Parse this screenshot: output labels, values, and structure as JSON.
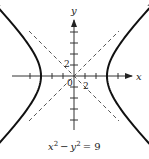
{
  "chart_data": {
    "type": "line",
    "title": "",
    "caption": "x² − y² = 9",
    "equation": {
      "lhs_x": "x",
      "lhs_x_exp": "2",
      "minus": "−",
      "lhs_y": "y",
      "lhs_y_exp": "2",
      "rhs": "= 9"
    },
    "xlabel": "x",
    "ylabel": "y",
    "origin_label": "0",
    "tick_labels": {
      "x": "2",
      "y": "2"
    },
    "xlim": [
      -5.5,
      5.5
    ],
    "ylim": [
      -5,
      5
    ],
    "grid": false,
    "legend": null,
    "series": [
      {
        "name": "hyperbola right branch",
        "style": "solid-thick",
        "vertex": [
          3,
          0
        ]
      },
      {
        "name": "hyperbola left branch",
        "style": "solid-thick",
        "vertex": [
          -3,
          0
        ]
      },
      {
        "name": "asymptote y = x",
        "style": "dashed"
      },
      {
        "name": "asymptote y = -x",
        "style": "dashed"
      }
    ],
    "tick_interval": 1
  },
  "colors": {
    "curve": "#111111",
    "axis": "#333333",
    "asymptote": "#444444"
  }
}
